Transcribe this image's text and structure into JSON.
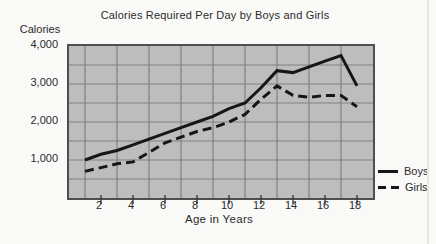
{
  "colors": {
    "paper": "#f9f9f7",
    "plot_background": "#bdbdbd",
    "grid_line": "#828282",
    "plot_border": "#4f4f4f",
    "data_line": "#161616",
    "text": "#2b2b2b"
  },
  "legend": {
    "items": [
      {
        "label": "Boys",
        "style": "solid"
      },
      {
        "label": "Girls",
        "style": "dashed"
      }
    ]
  },
  "chart_data": {
    "type": "line",
    "title": "Calories Required Per Day by Boys and Girls",
    "xlabel": "Age in Years",
    "ylabel": "Calories",
    "xlim": [
      0,
      19
    ],
    "ylim": [
      0,
      4000
    ],
    "grid": {
      "on": true,
      "x_lines": [
        1,
        3,
        5,
        7,
        9,
        11,
        13,
        15,
        17
      ],
      "y_lines": [
        500,
        1000,
        1500,
        2000,
        2500,
        3000,
        3500
      ]
    },
    "x_ticks": [
      2,
      4,
      6,
      8,
      10,
      12,
      14,
      16,
      18
    ],
    "x_tick_labels": [
      "2",
      "4",
      "6",
      "8",
      "10",
      "12",
      "14",
      "16",
      "18"
    ],
    "y_ticks": [
      {
        "value": 4000,
        "label": "4,000"
      },
      {
        "value": 3000,
        "label": "3,000"
      },
      {
        "value": 2000,
        "label": "2,000"
      },
      {
        "value": 1000,
        "label": "1,000"
      }
    ],
    "x": [
      1,
      2,
      3,
      4,
      5,
      6,
      7,
      8,
      9,
      10,
      11,
      12,
      13,
      14,
      15,
      16,
      17,
      18
    ],
    "series": [
      {
        "name": "Boys",
        "style": "solid",
        "values": [
          1000,
          1150,
          1250,
          1400,
          1550,
          1700,
          1850,
          2000,
          2150,
          2350,
          2500,
          2900,
          3350,
          3300,
          3450,
          3600,
          3750,
          2950
        ]
      },
      {
        "name": "Girls",
        "style": "dashed",
        "values": [
          700,
          800,
          900,
          950,
          1200,
          1450,
          1600,
          1750,
          1850,
          2000,
          2200,
          2600,
          2950,
          2700,
          2650,
          2700,
          2700,
          2400
        ]
      }
    ],
    "legend_position": "right-outside"
  }
}
